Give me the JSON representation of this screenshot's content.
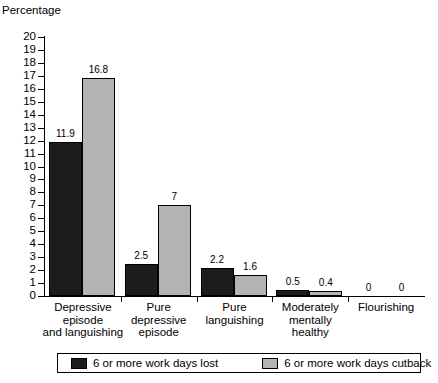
{
  "chart_data": {
    "type": "bar",
    "title": "",
    "ylabel": "Percentage",
    "xlabel": "",
    "ylim": [
      0,
      20
    ],
    "ytick_step": 1,
    "grid": false,
    "legend_position": "bottom",
    "categories": [
      "Depressive\nepisode\nand languishing",
      "Pure\ndepressive\nepisode",
      "Pure\nlanguishing",
      "Moderately\nmentally\nhealthy",
      "Flourishing"
    ],
    "yticks": [
      "20",
      "19",
      "18",
      "17",
      "16",
      "15",
      "14",
      "13",
      "12",
      "11",
      "10",
      "9",
      "8",
      "7",
      "6",
      "5",
      "4",
      "3",
      "2",
      "1",
      "0"
    ],
    "series": [
      {
        "name": "6 or more work days lost",
        "color": "#1c1c1c",
        "values": [
          11.9,
          2.5,
          2.2,
          0.5,
          0
        ],
        "labels": [
          "11.9",
          "2.5",
          "2.2",
          "0.5",
          "0"
        ]
      },
      {
        "name": "6 or more work days cutback",
        "color": "#b3b3b3",
        "values": [
          16.8,
          7,
          1.6,
          0.4,
          0
        ],
        "labels": [
          "16.8",
          "7",
          "1.6",
          "0.4",
          "0"
        ]
      }
    ]
  }
}
